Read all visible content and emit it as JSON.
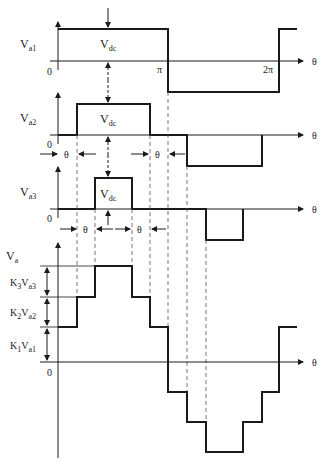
{
  "figure": {
    "colors": {
      "line": "#1a1a1a",
      "dashed": "#555555",
      "background": "#ffffff"
    }
  },
  "axis_label": "θ",
  "origin_label": "0",
  "waveforms": [
    {
      "id": "va1",
      "label": "V",
      "sub": "a1",
      "amplitude_label": "V",
      "amplitude_sub": "dc",
      "ticks": [
        "π",
        "2π"
      ]
    },
    {
      "id": "va2",
      "label": "V",
      "sub": "a2",
      "amplitude_label": "V",
      "amplitude_sub": "dc",
      "delay_label": "θ"
    },
    {
      "id": "va3",
      "label": "V",
      "sub": "a3",
      "amplitude_label": "V",
      "amplitude_sub": "dc",
      "delay_label": "θ"
    },
    {
      "id": "va",
      "label": "V",
      "sub": "a",
      "levels": [
        {
          "k": "K",
          "ksub": "3",
          "v": "V",
          "vsub": "a3"
        },
        {
          "k": "K",
          "ksub": "2",
          "v": "V",
          "vsub": "a2"
        },
        {
          "k": "K",
          "ksub": "1",
          "v": "V",
          "vsub": "a1"
        }
      ]
    }
  ]
}
